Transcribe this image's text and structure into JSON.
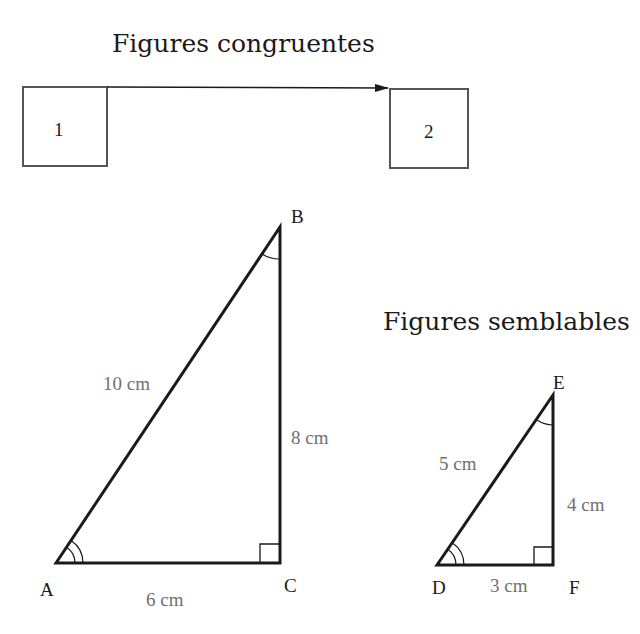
{
  "congruent": {
    "title": "Figures congruentes",
    "boxes": [
      {
        "label": "1"
      },
      {
        "label": "2"
      }
    ]
  },
  "similar": {
    "title": "Figures semblables",
    "triangle_large": {
      "vertices": {
        "A": "A",
        "B": "B",
        "C": "C"
      },
      "sides": {
        "AB": "10 cm",
        "BC": "8 cm",
        "AC": "6 cm"
      }
    },
    "triangle_small": {
      "vertices": {
        "D": "D",
        "E": "E",
        "F": "F"
      },
      "sides": {
        "DE": "5 cm",
        "EF": "4 cm",
        "DF": "3 cm"
      }
    }
  },
  "colors": {
    "stroke": "#1a1a1a",
    "box_stroke": "#555555",
    "measure_text": "#707070"
  }
}
